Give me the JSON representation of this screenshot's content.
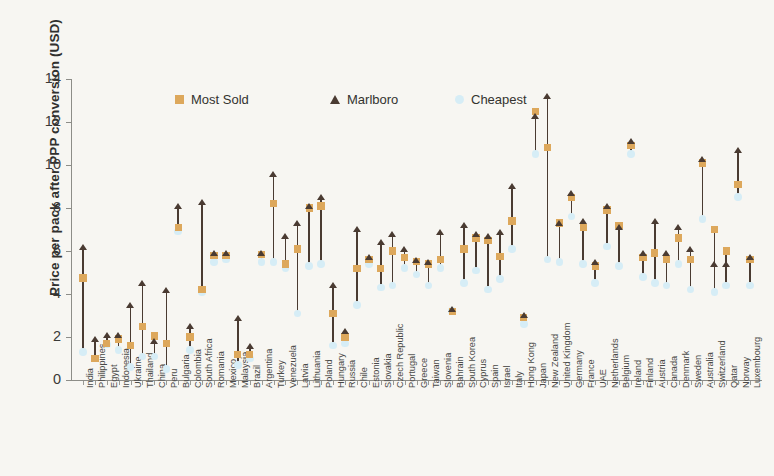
{
  "chart_data": {
    "type": "scatter",
    "title": "",
    "xlabel": "",
    "ylabel": "Price per pack after PPP conversion (USD)",
    "ylim": [
      0,
      14
    ],
    "yticks": [
      0,
      2,
      4,
      6,
      8,
      10,
      12,
      14
    ],
    "grid": false,
    "legend_position": "top-center",
    "legend": [
      {
        "name": "Most Sold",
        "marker": "square",
        "color": "#dda85c"
      },
      {
        "name": "Marlboro",
        "marker": "triangle",
        "color": "#4a3b32"
      },
      {
        "name": "Cheapest",
        "marker": "circle",
        "color": "#d6edf6"
      }
    ],
    "categories": [
      "India",
      "Philippines",
      "Egypt",
      "Indonesia",
      "Ukraine",
      "Thailand",
      "China",
      "Peru",
      "Bulgaria",
      "Colombia",
      "South Africa",
      "Romania",
      "Mexico",
      "Malaysia",
      "Brazil",
      "Argentina",
      "Turkey",
      "Venezuela",
      "Latvia",
      "Lithuania",
      "Poland",
      "Hungary",
      "Russia",
      "Chile",
      "Estonia",
      "Slovakia",
      "Czech Republic",
      "Portugal",
      "Greece",
      "Taiwan",
      "Slovenia",
      "Bahrain",
      "South Korea",
      "Cyprus",
      "Spain",
      "Israel",
      "Italy",
      "Hong Kong",
      "Japan",
      "New Zealand",
      "United Kingdom",
      "Germany",
      "France",
      "UAE",
      "Netherlands",
      "Belgium",
      "Ireland",
      "Finland",
      "Austria",
      "Canada",
      "Denmark",
      "Sweden",
      "Australia",
      "Switzerland",
      "Qatar",
      "Norway",
      "Luxembourg"
    ],
    "series": [
      {
        "name": "Marlboro",
        "marker": "triangle",
        "color": "#4a3b32",
        "values": [
          6.1,
          1.8,
          2.0,
          2.0,
          3.4,
          4.4,
          1.7,
          4.1,
          8.0,
          2.4,
          8.2,
          5.8,
          5.8,
          2.8,
          1.5,
          5.8,
          9.5,
          6.6,
          7.2,
          8.0,
          8.4,
          4.3,
          2.2,
          6.9,
          5.6,
          6.3,
          6.7,
          6.0,
          5.5,
          5.4,
          6.8,
          3.2,
          7.1,
          6.7,
          6.6,
          6.8,
          8.9,
          2.9,
          12.2,
          13.1,
          7.2,
          8.6,
          7.3,
          5.4,
          8.0,
          7.0,
          11.0,
          5.8,
          7.3,
          5.8,
          7.0,
          6.0,
          10.2,
          5.3,
          5.3,
          10.6,
          5.6
        ]
      },
      {
        "name": "Most Sold",
        "marker": "square",
        "color": "#dda85c",
        "values": [
          4.75,
          1.0,
          1.7,
          1.9,
          1.6,
          2.5,
          2.05,
          1.7,
          7.1,
          2.0,
          4.2,
          5.8,
          5.8,
          1.2,
          1.2,
          5.85,
          8.2,
          5.4,
          6.1,
          8.0,
          8.1,
          3.1,
          2.0,
          5.2,
          5.6,
          5.2,
          6.0,
          5.7,
          5.5,
          5.4,
          5.6,
          3.2,
          6.1,
          6.6,
          6.5,
          5.75,
          7.4,
          2.9,
          12.5,
          10.8,
          7.3,
          8.5,
          7.1,
          5.3,
          7.9,
          7.2,
          10.9,
          5.7,
          5.9,
          5.6,
          6.6,
          5.6,
          10.1,
          7.0,
          6.0,
          9.1,
          5.6
        ]
      },
      {
        "name": "Cheapest",
        "marker": "circle",
        "color": "#d6edf6",
        "values": [
          1.3,
          1.0,
          1.65,
          1.4,
          0.6,
          1.1,
          1.1,
          0.5,
          6.9,
          1.4,
          4.1,
          5.5,
          5.6,
          0.7,
          1.0,
          5.5,
          5.5,
          5.2,
          3.1,
          5.3,
          5.4,
          1.6,
          1.7,
          3.5,
          5.4,
          4.3,
          4.4,
          5.2,
          4.9,
          4.4,
          5.2,
          3.2,
          4.5,
          5.1,
          4.2,
          4.7,
          6.1,
          2.6,
          10.5,
          5.6,
          5.5,
          7.6,
          5.4,
          4.5,
          6.2,
          5.3,
          10.5,
          4.8,
          4.5,
          4.4,
          5.4,
          4.2,
          7.5,
          4.1,
          4.4,
          8.5,
          4.4
        ]
      }
    ]
  }
}
